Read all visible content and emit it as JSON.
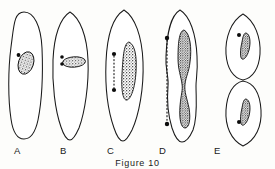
{
  "figure": {
    "caption": "Figure 10",
    "background_color": "#fdfdfb",
    "ink_color": "#1a1a1a",
    "nucleus_fill": "#8f8f8f",
    "panels": [
      {
        "label": "A",
        "stage_description": "interphase cell with oval nucleus and single centriole",
        "cell_shape": "elongated oval, blunt rounded top",
        "nucleus_shape": "tilted bean-shaped oval",
        "centriole_count": 1,
        "spindle": "none"
      },
      {
        "label": "B",
        "stage_description": "centriole pair duplicated beside elongating nucleus",
        "cell_shape": "pointed oval spindle-form",
        "nucleus_shape": "horizontal elongated rod",
        "centriole_count": 2,
        "spindle": "none"
      },
      {
        "label": "C",
        "stage_description": "centrioles separating, spindle fibers forming",
        "cell_shape": "pointed oval spindle-form",
        "nucleus_shape": "vertical elongated rod",
        "centriole_count": 2,
        "spindle": "short dotted line between poles"
      },
      {
        "label": "D",
        "stage_description": "cell constricting, nucleus pinched into dumbbell",
        "cell_shape": "constricted waisted outline",
        "nucleus_shape": "hourglass dumbbell",
        "centriole_count": 2,
        "spindle": "long dotted line between poles"
      },
      {
        "label": "E",
        "stage_description": "two separated daughter cells each with nucleus and centriole",
        "cell_shape": "two oval daughter cells",
        "nucleus_shape": "short tilted rod in each cell",
        "centriole_count": 2,
        "spindle": "none"
      }
    ]
  }
}
